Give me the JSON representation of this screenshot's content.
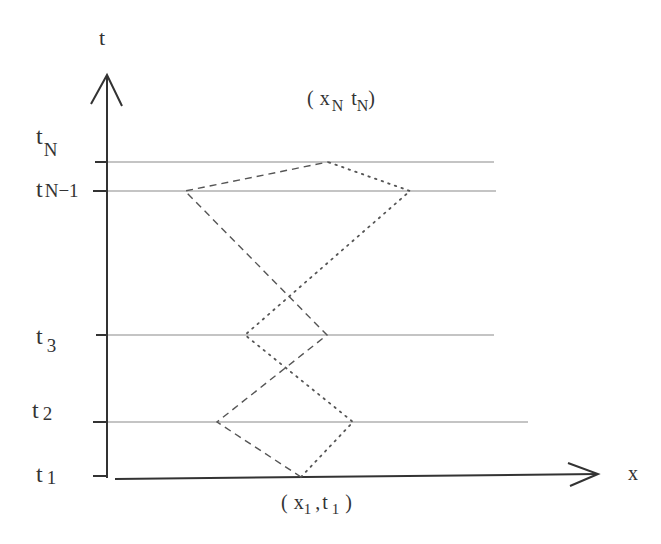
{
  "diagram": {
    "axes": {
      "y_label": "t",
      "x_label": "x"
    },
    "levels": [
      {
        "name": "t_N",
        "base": "t",
        "sub": "N",
        "y": 162
      },
      {
        "name": "t_N-1",
        "base": "t",
        "sub": "N−1",
        "y": 191
      },
      {
        "name": "t_3",
        "base": "t",
        "sub": "3",
        "y": 335
      },
      {
        "name": "t_2",
        "base": "t",
        "sub": "2",
        "y": 422
      },
      {
        "name": "t_1",
        "base": "t",
        "sub": "1",
        "y": 477
      }
    ],
    "points": {
      "top": {
        "open": "(",
        "x": "x",
        "x_sub": "N",
        "t": "t",
        "t_sub": "N",
        "close": ")"
      },
      "bottom": {
        "open": "(",
        "x": "x",
        "x_sub": "1",
        "sep": ",",
        "t": "t",
        "t_sub": "1",
        "close": ")"
      }
    },
    "paths": {
      "dashed": "zig-zag path from (x1,t1) to (xN,tN)",
      "dotted": "zig-zag path from (x1,t1) to (xN,tN)"
    },
    "colors": {
      "axis": "#333333",
      "grid_line": "#888888",
      "path": "#555555"
    }
  }
}
